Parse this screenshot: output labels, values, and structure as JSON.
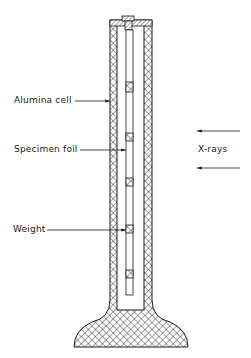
{
  "figure": {
    "type": "schematic"
  },
  "labels": {
    "alumina_cell": "Alumina cell",
    "specimen_foil": "Specimen foil",
    "weight": "Weight",
    "xrays": "X-rays"
  },
  "colors": {
    "line": "#1a1a1a",
    "background": "#ffffff"
  }
}
